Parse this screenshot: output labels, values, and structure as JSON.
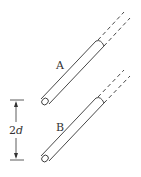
{
  "diagram": {
    "wires": [
      {
        "label": "A",
        "solid": {
          "x1": 45,
          "y1": 101,
          "x2": 100,
          "y2": 44
        },
        "dashed_end": {
          "x": 128,
          "y": 12
        }
      },
      {
        "label": "B",
        "solid": {
          "x1": 45,
          "y1": 158,
          "x2": 100,
          "y2": 101
        },
        "dashed_end": {
          "x": 128,
          "y": 70
        }
      }
    ],
    "dimension": {
      "label_num": "2",
      "label_var": "d",
      "top_y": 100,
      "bottom_y": 160,
      "x": 16
    },
    "colors": {
      "stroke": "#333333",
      "background": "#ffffff"
    }
  }
}
